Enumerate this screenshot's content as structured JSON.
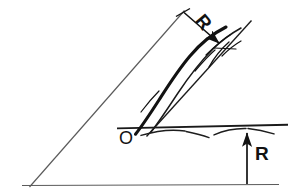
{
  "figure": {
    "background_color": "#ffffff",
    "ink_color": "#121212",
    "thin_line_color": "#4a4a4a",
    "labels": {
      "radius_top": "R",
      "radius_bottom": "R",
      "origin": "O"
    },
    "elements": {
      "inclined_guide_line": {
        "name": "inclined-guide-line",
        "from": [
          30,
          186
        ],
        "to": [
          184,
          11
        ],
        "style": "thin"
      },
      "ground_line_lower": {
        "name": "lower-ground-line",
        "from": [
          22,
          185
        ],
        "to": [
          279,
          185
        ],
        "style": "thin"
      },
      "ground_line_upper": {
        "name": "upper-ground-line",
        "from": [
          117,
          128
        ],
        "to": [
          288,
          125
        ],
        "style": "medium"
      },
      "hatch_marks": {
        "name": "ground-hatch-marks",
        "count": 3,
        "description": "drooping curved ticks beneath the upper ground line"
      },
      "trajectory_curve": {
        "name": "trajectory-curve",
        "start": [
          136,
          134
        ],
        "end": [
          239,
          27
        ],
        "style": "thick"
      },
      "tangent_line": {
        "name": "tangent-straight-line",
        "from": [
          147,
          136
        ],
        "to": [
          251,
          21
        ],
        "style": "thin"
      },
      "arrow_radius_top": {
        "name": "radius-arrow-top",
        "from": [
          184,
          13
        ],
        "to": [
          224,
          47
        ],
        "head": "filled"
      },
      "arrow_radius_bottom": {
        "name": "radius-arrow-bottom",
        "from": [
          247,
          184
        ],
        "to": [
          247,
          129
        ],
        "head": "filled"
      }
    }
  }
}
